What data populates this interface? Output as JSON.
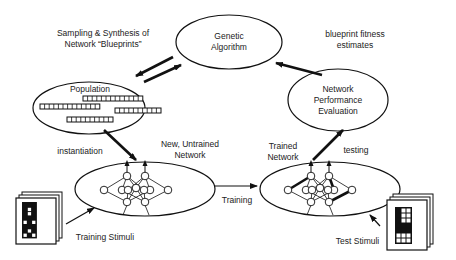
{
  "nodes": {
    "genetic_algorithm": "Genetic\nAlgorithm",
    "population": "Population",
    "performance_evaluation": "Network\nPerformance\nEvaluation"
  },
  "labels": {
    "sampling": "Sampling & Synthesis of\nNetwork “Blueprints”",
    "fitness": "blueprint fitness\nestimates",
    "instantiation": "instantiation",
    "new_network": "New, Untrained\nNetwork",
    "trained_network": "Trained\nNetwork",
    "testing": "testing",
    "training": "Training",
    "training_stimuli": "Training Stimuli",
    "test_stimuli": "Test Stimuli"
  },
  "population_blueprints": [
    {
      "cells": 13
    },
    {
      "cells": 13
    },
    {
      "cells": 10
    },
    {
      "cells": 10
    }
  ],
  "training_pattern": [
    [
      1,
      1,
      1
    ],
    [
      1,
      0,
      1
    ],
    [
      1,
      0,
      1
    ],
    [
      1,
      1,
      1
    ],
    [
      0,
      1,
      0
    ],
    [
      1,
      1,
      1
    ],
    [
      1,
      0,
      1
    ],
    [
      0,
      1,
      0
    ]
  ],
  "test_pattern": [
    [
      1,
      0,
      0
    ],
    [
      1,
      0,
      0
    ],
    [
      1,
      0,
      0
    ],
    [
      1,
      1,
      1
    ],
    [
      1,
      1,
      1
    ],
    [
      0,
      0,
      0
    ],
    [
      0,
      0,
      0
    ]
  ],
  "colors": {
    "stroke": "#111111",
    "text": "#222222",
    "background": "#ffffff"
  }
}
